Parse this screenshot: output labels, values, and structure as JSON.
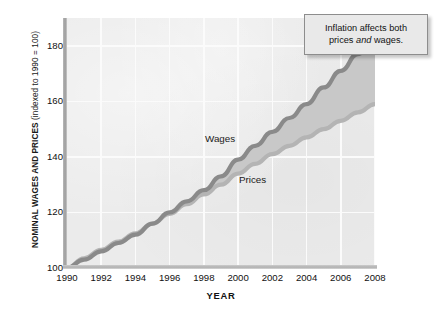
{
  "axes": {
    "y_title_main": "NOMINAL WAGES AND PRICES",
    "y_title_sub": "(indexed to 1990 = 100)",
    "x_title": "YEAR"
  },
  "callout": {
    "line1": "Inflation affects both",
    "line2_pre": "prices ",
    "line2_em": "and",
    "line2_post": " wages."
  },
  "series_labels": {
    "wages": "Wages",
    "prices": "Prices"
  },
  "colors": {
    "plot_background": "#ebebeb",
    "gridline": "#fbfbfb",
    "wages_line": "#8a8a8a",
    "prices_line": "#b4b4b4",
    "band_fill": "#c8c8c8",
    "callout_background": "#e9e9e9",
    "callout_border": "#8d8d8d",
    "axis_spine": "#a8a8a8",
    "text": "#111111"
  },
  "chart_data": {
    "type": "area",
    "title": "",
    "subtitle": "",
    "xlabel": "YEAR",
    "ylabel": "NOMINAL WAGES AND PRICES (indexed to 1990 = 100)",
    "xlim": [
      1990,
      2008
    ],
    "ylim": [
      100,
      190
    ],
    "yticks": [
      100,
      120,
      140,
      160,
      180
    ],
    "xticks": [
      1990,
      1992,
      1994,
      1996,
      1998,
      2000,
      2002,
      2004,
      2006,
      2008
    ],
    "grid": true,
    "legend": "inline-labels",
    "x": [
      1990,
      1991,
      1992,
      1993,
      1994,
      1995,
      1996,
      1997,
      1998,
      1999,
      2000,
      2001,
      2002,
      2003,
      2004,
      2005,
      2006,
      2007,
      2008
    ],
    "series": [
      {
        "name": "Wages",
        "color": "#8a8a8a",
        "values": [
          100,
          103,
          106,
          109,
          112,
          116,
          120,
          124,
          128,
          133,
          139,
          144,
          149,
          154,
          159,
          165,
          171,
          177,
          183
        ]
      },
      {
        "name": "Prices",
        "color": "#b4b4b4",
        "values": [
          100,
          103.5,
          106.5,
          109.5,
          112.5,
          116,
          119.5,
          123,
          126.5,
          130,
          134,
          137.5,
          141,
          144,
          147,
          150,
          153,
          156,
          159
        ]
      }
    ],
    "annotations": [
      {
        "text": "Inflation affects both prices and wages.",
        "type": "callout",
        "anchor_x": 2007,
        "anchor_y": 183
      }
    ]
  }
}
